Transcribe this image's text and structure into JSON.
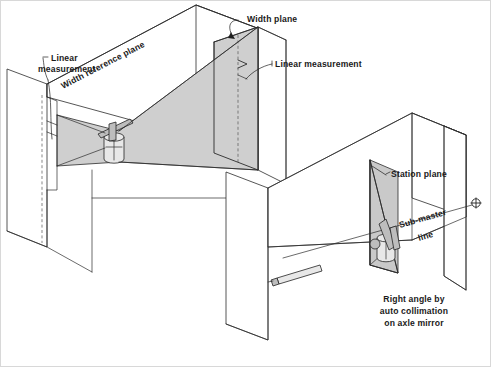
{
  "figure": {
    "background_color": "#ffffff",
    "line_color": "#2b2b2b",
    "shade_color": "#cfcfcf",
    "width_px": 491,
    "height_px": 367
  },
  "labels": {
    "linear_measurement_left_line1": "Linear",
    "linear_measurement_left_line2": "measurement",
    "width_reference_plane": "Width reference plane",
    "width_plane": "Width plane",
    "linear_measurement_right": "Linear measurement",
    "station_plane": "Station plane",
    "sub_master_line_1": "Sub-master",
    "sub_master_line_2": "line",
    "caption_line1": "Right angle by",
    "caption_line2": "auto collimation",
    "caption_line3": "on axle mirror"
  },
  "icons": {
    "target": "crosshair-target-icon",
    "instrument_left": "theodolite-instrument-icon",
    "instrument_right": "theodolite-instrument-icon",
    "collimator": "collimator-telescope-icon"
  }
}
